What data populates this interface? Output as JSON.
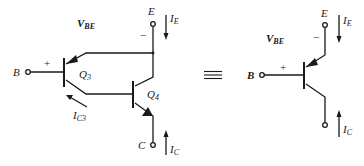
{
  "diagram": {
    "left_circuit": {
      "title": "Darlington-like composite (Q3 PNP + Q4 NPN)",
      "labels": {
        "vbe_main": "V",
        "vbe_sub": "BE",
        "terminal_e": "E",
        "terminal_b": "B",
        "terminal_c": "C",
        "ie_main": "I",
        "ie_sub": "E",
        "ic_main": "I",
        "ic_sub": "C",
        "ic3_main": "I",
        "ic3_sub": "C3",
        "q3_main": "Q",
        "q3_sub": "3",
        "q4_main": "Q",
        "q4_sub": "4",
        "plus": "+",
        "minus": "−"
      }
    },
    "equivalence_symbol": "≡",
    "right_circuit": {
      "title": "Equivalent PNP transistor",
      "labels": {
        "vbe_main": "V",
        "vbe_sub": "BE",
        "terminal_e": "E",
        "terminal_b": "B",
        "terminal_c": "C",
        "ie_main": "I",
        "ie_sub": "E",
        "ic_main": "I",
        "ic_sub": "C",
        "plus": "+",
        "minus": "−"
      }
    },
    "colors": {
      "line": "#1a1a1a",
      "background": "#ffffff"
    }
  }
}
